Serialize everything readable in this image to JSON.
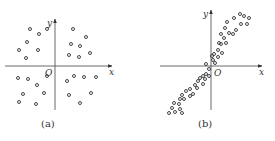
{
  "figures": [
    {
      "id": "a",
      "caption": "(a)",
      "x_label": "x",
      "y_label": "y",
      "origin_label": "O",
      "description": "scattered points with no correlation",
      "origin": [
        55,
        66
      ],
      "x_axis": [
        5,
        112
      ],
      "y_axis": [
        110,
        19
      ],
      "points": [
        [
          30,
          29
        ],
        [
          39,
          34
        ],
        [
          47,
          29
        ],
        [
          27,
          42
        ],
        [
          19,
          50
        ],
        [
          38,
          50
        ],
        [
          26,
          58
        ],
        [
          73,
          29
        ],
        [
          86,
          37
        ],
        [
          71,
          44
        ],
        [
          80,
          46
        ],
        [
          69,
          55
        ],
        [
          79,
          57
        ],
        [
          90,
          53
        ],
        [
          18,
          78
        ],
        [
          28,
          79
        ],
        [
          47,
          76
        ],
        [
          37,
          85
        ],
        [
          44,
          93
        ],
        [
          23,
          94
        ],
        [
          19,
          102
        ],
        [
          36,
          104
        ],
        [
          67,
          81
        ],
        [
          74,
          76
        ],
        [
          84,
          77
        ],
        [
          96,
          77
        ],
        [
          69,
          95
        ],
        [
          91,
          93
        ],
        [
          80,
          103
        ]
      ]
    },
    {
      "id": "b",
      "caption": "(b)",
      "x_label": "x",
      "y_label": "y",
      "origin_label": "O",
      "description": "points clustered along a positively sloped line",
      "origin": [
        211,
        66
      ],
      "x_axis": [
        160,
        262
      ],
      "y_axis": [
        110,
        10
      ],
      "points": [
        [
          240,
          14
        ],
        [
          244,
          16
        ],
        [
          249,
          18
        ],
        [
          234,
          18
        ],
        [
          241,
          24
        ],
        [
          247,
          24
        ],
        [
          227,
          22
        ],
        [
          236,
          30
        ],
        [
          225,
          28
        ],
        [
          221,
          34
        ],
        [
          229,
          33
        ],
        [
          233,
          34
        ],
        [
          224,
          38
        ],
        [
          219,
          43
        ],
        [
          226,
          43
        ],
        [
          221,
          44
        ],
        [
          218,
          50
        ],
        [
          222,
          53
        ],
        [
          214,
          54
        ],
        [
          212,
          56
        ],
        [
          218,
          57
        ],
        [
          213,
          60
        ],
        [
          215,
          63
        ],
        [
          206,
          64
        ],
        [
          209,
          69
        ],
        [
          206,
          74
        ],
        [
          203,
          76
        ],
        [
          209,
          76
        ],
        [
          200,
          78
        ],
        [
          205,
          79
        ],
        [
          198,
          81
        ],
        [
          203,
          84
        ],
        [
          195,
          85
        ],
        [
          190,
          89
        ],
        [
          197,
          88
        ],
        [
          186,
          91
        ],
        [
          193,
          94
        ],
        [
          182,
          95
        ],
        [
          190,
          96
        ],
        [
          180,
          99
        ],
        [
          184,
          99
        ],
        [
          174,
          103
        ],
        [
          179,
          104
        ],
        [
          172,
          108
        ],
        [
          180,
          109
        ],
        [
          169,
          113
        ],
        [
          175,
          112
        ],
        [
          182,
          113
        ]
      ]
    }
  ],
  "chart_data": [
    {
      "type": "scatter",
      "title": "(a)",
      "xlabel": "x",
      "ylabel": "y",
      "grid": false,
      "note": "no correlation; points spread in all four quadrants",
      "x": [
        -8.3,
        -5.3,
        -2.7,
        -9.3,
        -12,
        -5.7,
        -9.7,
        6,
        10.3,
        5.3,
        8.3,
        4.7,
        8,
        11.7,
        -12.3,
        -9,
        -2.7,
        -6,
        -3.7,
        -10.7,
        -12,
        -6.3,
        4,
        6.3,
        9.7,
        13.7,
        4.7,
        12,
        8.3
      ],
      "y": [
        12.3,
        10.7,
        12.3,
        8,
        5.3,
        5.3,
        2.7,
        12.3,
        9.7,
        7.3,
        6.7,
        3.7,
        3,
        4.3,
        -4,
        -4.3,
        -3.3,
        -6.3,
        -9,
        -9.3,
        -12,
        -12.7,
        -5,
        -3.3,
        -3.7,
        -3.7,
        -9.7,
        -9,
        -12.3
      ]
    },
    {
      "type": "scatter",
      "title": "(b)",
      "xlabel": "x",
      "ylabel": "y",
      "grid": false,
      "note": "strong positive linear correlation through origin",
      "x": [
        9.7,
        11,
        12.7,
        7.7,
        10,
        12,
        5.3,
        8.3,
        4.7,
        3.3,
        6,
        7.3,
        4.3,
        2.7,
        5,
        3.3,
        2.3,
        3.7,
        1,
        0.3,
        2.3,
        0.7,
        1.3,
        -1.7,
        -0.7,
        -1.7,
        -2.7,
        -0.7,
        -3.7,
        -2,
        -4.3,
        -2.7,
        -5.3,
        -7,
        -4.7,
        -8.3,
        -6,
        -9.7,
        -7,
        -10.3,
        -9,
        -12.3,
        -10.7,
        -13,
        -10.3,
        -14,
        -12,
        -9.7
      ],
      "y": [
        17.3,
        16.7,
        16,
        16,
        14,
        14,
        14.7,
        12,
        12.7,
        10.7,
        11,
        10.7,
        9.3,
        7.7,
        7.7,
        7.3,
        5.3,
        4.3,
        4,
        3.3,
        3,
        2,
        1,
        0.7,
        -1,
        -2.7,
        -3.3,
        -3.3,
        -4,
        -4.3,
        -5,
        -6,
        -6.3,
        -7.7,
        -7.3,
        -8.3,
        -9.3,
        -9.7,
        -10,
        -11,
        -11,
        -12.3,
        -12.7,
        -14,
        -14.3,
        -15.7,
        -15.3,
        -15.7
      ]
    }
  ]
}
